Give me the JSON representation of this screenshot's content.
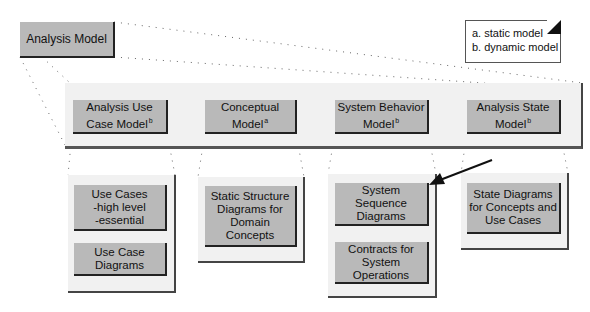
{
  "diagram": {
    "root": {
      "label": "Analysis Model"
    },
    "legend": {
      "items": [
        "a. static model",
        "b. dynamic model"
      ]
    },
    "models": [
      {
        "label": "Analysis Use\nCase Model",
        "superscript": "b"
      },
      {
        "label": "Conceptual\nModel",
        "superscript": "a"
      },
      {
        "label": "System Behavior\nModel",
        "superscript": "b"
      },
      {
        "label": "Analysis State\nModel",
        "superscript": "b"
      }
    ],
    "artifacts": [
      {
        "model": "Analysis Use Case Model",
        "items": [
          "Use Cases\n  -high level\n  -essential",
          "Use Case\nDiagrams"
        ]
      },
      {
        "model": "Conceptual Model",
        "items": [
          "Static Structure\nDiagrams for\nDomain\nConcepts"
        ]
      },
      {
        "model": "System Behavior Model",
        "items": [
          "System\nSequence\nDiagrams",
          "Contracts for\nSystem\nOperations"
        ]
      },
      {
        "model": "Analysis State Model",
        "items": [
          "State Diagrams\nfor Concepts and\nUse Cases"
        ]
      }
    ],
    "highlight_arrow": {
      "points_to": "System Sequence Diagrams"
    }
  }
}
